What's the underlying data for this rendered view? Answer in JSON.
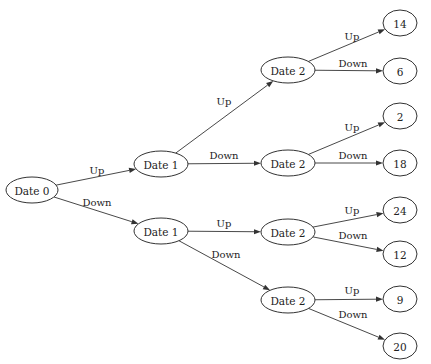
{
  "diagram": {
    "type": "binomial-tree",
    "nodes": [
      {
        "id": "n0",
        "label": "Date 0",
        "cx": 32,
        "cy": 190,
        "rx": 26,
        "ry": 13
      },
      {
        "id": "n1u",
        "label": "Date 1",
        "cx": 161,
        "cy": 164,
        "rx": 27,
        "ry": 13
      },
      {
        "id": "n1d",
        "label": "Date 1",
        "cx": 161,
        "cy": 231,
        "rx": 27,
        "ry": 13
      },
      {
        "id": "n2uu",
        "label": "Date 2",
        "cx": 288,
        "cy": 70,
        "rx": 27,
        "ry": 13
      },
      {
        "id": "n2ud",
        "label": "Date 2",
        "cx": 288,
        "cy": 163,
        "rx": 27,
        "ry": 13
      },
      {
        "id": "n2du",
        "label": "Date 2",
        "cx": 288,
        "cy": 232,
        "rx": 27,
        "ry": 13
      },
      {
        "id": "n2dd",
        "label": "Date 2",
        "cx": 288,
        "cy": 300,
        "rx": 27,
        "ry": 13
      },
      {
        "id": "l1",
        "label": "14",
        "cx": 400,
        "cy": 23,
        "rx": 17,
        "ry": 13
      },
      {
        "id": "l2",
        "label": "6",
        "cx": 400,
        "cy": 71,
        "rx": 17,
        "ry": 13
      },
      {
        "id": "l3",
        "label": "2",
        "cx": 400,
        "cy": 116,
        "rx": 17,
        "ry": 13
      },
      {
        "id": "l4",
        "label": "18",
        "cx": 400,
        "cy": 163,
        "rx": 17,
        "ry": 13
      },
      {
        "id": "l5",
        "label": "24",
        "cx": 400,
        "cy": 210,
        "rx": 17,
        "ry": 13
      },
      {
        "id": "l6",
        "label": "12",
        "cx": 400,
        "cy": 254,
        "rx": 17,
        "ry": 13
      },
      {
        "id": "l7",
        "label": "9",
        "cx": 400,
        "cy": 299,
        "rx": 17,
        "ry": 13
      },
      {
        "id": "l8",
        "label": "20",
        "cx": 400,
        "cy": 346,
        "rx": 17,
        "ry": 13
      }
    ],
    "edges": [
      {
        "from": "n0",
        "to": "n1u",
        "label": "Up",
        "lx": 97,
        "ly": 174
      },
      {
        "from": "n0",
        "to": "n1d",
        "label": "Down",
        "lx": 97,
        "ly": 206
      },
      {
        "from": "n1u",
        "to": "n2uu",
        "label": "Up",
        "lx": 224,
        "ly": 105
      },
      {
        "from": "n1u",
        "to": "n2ud",
        "label": "Down",
        "lx": 224,
        "ly": 159
      },
      {
        "from": "n1d",
        "to": "n2du",
        "label": "Up",
        "lx": 224,
        "ly": 227
      },
      {
        "from": "n1d",
        "to": "n2dd",
        "label": "Down",
        "lx": 226,
        "ly": 258
      },
      {
        "from": "n2uu",
        "to": "l1",
        "label": "Up",
        "lx": 352,
        "ly": 40
      },
      {
        "from": "n2uu",
        "to": "l2",
        "label": "Down",
        "lx": 353,
        "ly": 67
      },
      {
        "from": "n2ud",
        "to": "l3",
        "label": "Up",
        "lx": 352,
        "ly": 131
      },
      {
        "from": "n2ud",
        "to": "l4",
        "label": "Down",
        "lx": 353,
        "ly": 159
      },
      {
        "from": "n2du",
        "to": "l5",
        "label": "Up",
        "lx": 352,
        "ly": 214
      },
      {
        "from": "n2du",
        "to": "l6",
        "label": "Down",
        "lx": 353,
        "ly": 239
      },
      {
        "from": "n2dd",
        "to": "l7",
        "label": "Up",
        "lx": 352,
        "ly": 294
      },
      {
        "from": "n2dd",
        "to": "l8",
        "label": "Down",
        "lx": 353,
        "ly": 318
      }
    ]
  }
}
